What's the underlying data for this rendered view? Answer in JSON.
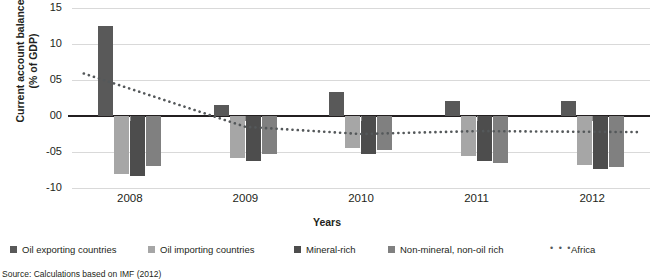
{
  "axis": {
    "y_title_line1": "Current account balance",
    "y_title_line2": "(% of GDP)",
    "x_title": "Years",
    "y_ticks": [
      "15",
      "10",
      "05",
      "00",
      "-05",
      "-10"
    ]
  },
  "legend": [
    {
      "label": "Oil exporting countries",
      "color": "#595959",
      "type": "swatch"
    },
    {
      "label": "Oil importing countries",
      "color": "#a6a6a6",
      "type": "swatch"
    },
    {
      "label": "Mineral-rich",
      "color": "#4d4d4d",
      "type": "swatch"
    },
    {
      "label": "Non-mineral, non-oil rich",
      "color": "#808080",
      "type": "swatch"
    },
    {
      "label": "Africa",
      "color": "#54585a",
      "type": "dotted",
      "glyph": "• • •"
    }
  ],
  "source": "Source: Calculations based on IMF (2012)",
  "chart_data": {
    "type": "bar",
    "title": "",
    "xlabel": "Years",
    "ylabel": "Current account balance (% of GDP)",
    "categories": [
      "2008",
      "2009",
      "2010",
      "2011",
      "2012"
    ],
    "ylim": [
      -10,
      15
    ],
    "yticks": [
      15,
      10,
      5,
      0,
      -5,
      -10
    ],
    "ytick_labels": [
      "15",
      "10",
      "05",
      "00",
      "-05",
      "-10"
    ],
    "grid": true,
    "legend_position": "bottom",
    "series": [
      {
        "name": "Oil exporting countries",
        "color": "#595959",
        "values": [
          12.5,
          1.5,
          3.3,
          2.1,
          2.1
        ]
      },
      {
        "name": "Oil importing countries",
        "color": "#a6a6a6",
        "values": [
          -8.0,
          -5.8,
          -4.4,
          -5.6,
          -6.8
        ]
      },
      {
        "name": "Mineral-rich",
        "color": "#4d4d4d",
        "values": [
          -8.3,
          -6.2,
          -5.3,
          -6.2,
          -7.4
        ]
      },
      {
        "name": "Non-mineral, non-oil rich",
        "color": "#808080",
        "values": [
          -7.0,
          -5.3,
          -4.7,
          -6.5,
          -7.1
        ]
      }
    ],
    "line_series": [
      {
        "name": "Africa",
        "color": "#54585a",
        "style": "dotted",
        "values": [
          3.8,
          -1.5,
          -2.5,
          -2.1,
          -2.2
        ]
      }
    ]
  }
}
